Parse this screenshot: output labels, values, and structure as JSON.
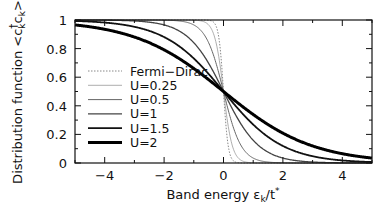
{
  "chart_data": {
    "type": "line",
    "title": "",
    "xlabel": "Band energy εk/t*",
    "ylabel": "Distribution function <c†k ck>",
    "xlim": [
      -5,
      5
    ],
    "ylim": [
      0,
      1
    ],
    "xticks": [
      -4,
      -2,
      0,
      2,
      4
    ],
    "xtick_labels": [
      "−4",
      "−2",
      "0",
      "2",
      "4"
    ],
    "yticks": [
      0,
      0.2,
      0.4,
      0.6,
      0.8,
      1
    ],
    "ytick_labels": [
      "0",
      "0.2",
      "0.4",
      "0.6",
      "0.8",
      "1"
    ],
    "grid": false,
    "legend_position": "left-center inside plot",
    "series": [
      {
        "name": "Fermi−Dirac",
        "style": "dotted",
        "width": 1,
        "color": "#888888",
        "width_param": 0.08
      },
      {
        "name": "U=0.25",
        "style": "solid",
        "width": 0.8,
        "color": "#999999",
        "width_param": 0.15
      },
      {
        "name": "U=0.5",
        "style": "solid",
        "width": 1,
        "color": "#666666",
        "width_param": 0.3
      },
      {
        "name": "U=1",
        "style": "solid",
        "width": 1.3,
        "color": "#444444",
        "width_param": 0.6
      },
      {
        "name": "U=1.5",
        "style": "solid",
        "width": 1.8,
        "color": "#111111",
        "width_param": 1.0
      },
      {
        "name": "U=2",
        "style": "solid",
        "width": 3,
        "color": "#000000",
        "width_param": 1.5
      }
    ],
    "x": [
      -5,
      -4,
      -3,
      -2,
      -1,
      -0.5,
      0,
      0.5,
      1,
      2,
      3,
      4,
      5
    ],
    "series_values_approx": {
      "Fermi−Dirac": [
        1.0,
        1.0,
        1.0,
        1.0,
        1.0,
        1.0,
        0.5,
        0.0,
        0.0,
        0.0,
        0.0,
        0.0,
        0.0
      ],
      "U=0.25": [
        1.0,
        1.0,
        1.0,
        1.0,
        0.99,
        0.96,
        0.5,
        0.04,
        0.01,
        0.0,
        0.0,
        0.0,
        0.0
      ],
      "U=0.5": [
        1.0,
        1.0,
        1.0,
        1.0,
        0.97,
        0.84,
        0.5,
        0.16,
        0.03,
        0.0,
        0.0,
        0.0,
        0.0
      ],
      "U=1": [
        1.0,
        0.99,
        0.99,
        0.96,
        0.84,
        0.7,
        0.5,
        0.3,
        0.16,
        0.04,
        0.01,
        0.01,
        0.0
      ],
      "U=1.5": [
        0.99,
        0.98,
        0.95,
        0.88,
        0.73,
        0.62,
        0.5,
        0.38,
        0.27,
        0.12,
        0.05,
        0.02,
        0.01
      ],
      "U=2": [
        0.97,
        0.94,
        0.88,
        0.79,
        0.66,
        0.58,
        0.5,
        0.42,
        0.34,
        0.21,
        0.12,
        0.06,
        0.03
      ]
    }
  },
  "axes": {
    "xlabel_main": "Band energy ε",
    "xlabel_sub": "k",
    "xlabel_tail": "/t",
    "xlabel_sup": "*",
    "ylabel_main": "Distribution function <c",
    "ylabel_sup": "†",
    "ylabel_sub1": "k",
    "ylabel_mid": "c",
    "ylabel_sub2": "k",
    "ylabel_tail": ">"
  }
}
